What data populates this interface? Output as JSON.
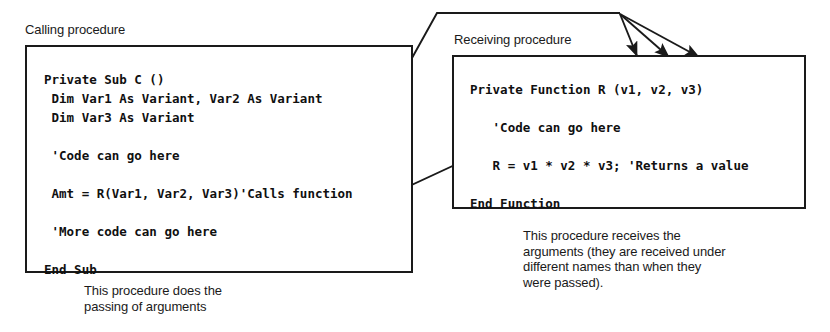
{
  "diagram": {
    "background_color": "#ffffff",
    "line_color": "#1a1a1a",
    "text_color": "#1a1a1a"
  },
  "calling": {
    "caption": "Calling procedure",
    "code": "Private Sub C ()\n Dim Var1 As Variant, Var2 As Variant\n Dim Var3 As Variant\n\n 'Code can go here\n\n Amt = R(Var1, Var2, Var3)'Calls function\n\n 'More code can go here\n\nEnd Sub",
    "note": "This procedure does the\npassing of arguments"
  },
  "receiving": {
    "caption": "Receiving procedure",
    "code": "Private Function R (v1, v2, v3)\n\n   'Code can go here\n\n   R = v1 * v2 * v3; 'Returns a value\n\nEnd Function",
    "note": "This procedure receives the\narguments (they are received under\ndifferent names than when they\nwere passed)."
  },
  "connectors": {
    "argument_fan_label": "arguments passed from call site to function parameters",
    "return_label": "returned value flows back to Amt"
  }
}
